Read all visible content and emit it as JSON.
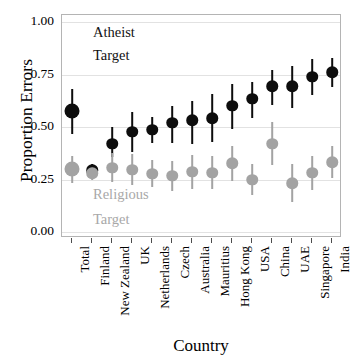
{
  "chart_data": {
    "type": "scatter",
    "title": "",
    "xlabel": "Country",
    "ylabel": "Proportion Errors",
    "ylim": [
      0.0,
      1.0
    ],
    "yticks": [
      "0.00",
      "0.25",
      "0.50",
      "0.75",
      "1.00"
    ],
    "ytick_values": [
      0.0,
      0.25,
      0.5,
      0.75,
      1.0
    ],
    "grid": "horizontal",
    "legend_position": "inside-plot-annotations",
    "categories": [
      "Total",
      "Finland",
      "New Zealand",
      "UK",
      "Netherlands",
      "Czech",
      "Australia",
      "Mauritius",
      "Hong Kong",
      "USA",
      "China",
      "UAE",
      "Singapore",
      "India"
    ],
    "annotations": [
      {
        "text": "Atheist",
        "series": "Atheist Target"
      },
      {
        "text": "Target",
        "series": "Atheist Target"
      },
      {
        "text": "Religious",
        "series": "Religious Target"
      },
      {
        "text": "Target",
        "series": "Religious Target"
      }
    ],
    "series": [
      {
        "name": "Atheist Target",
        "color": "#0d0d0d",
        "marker": "filled-circle",
        "values": [
          0.575,
          0.295,
          0.42,
          0.478,
          0.487,
          0.52,
          0.532,
          0.541,
          0.601,
          0.634,
          0.693,
          0.694,
          0.74,
          0.761
        ],
        "err_low": [
          0.468,
          0.262,
          0.358,
          0.382,
          0.425,
          0.423,
          0.42,
          0.43,
          0.492,
          0.542,
          0.605,
          0.592,
          0.65,
          0.69
        ],
        "err_high": [
          0.681,
          0.325,
          0.498,
          0.573,
          0.548,
          0.598,
          0.626,
          0.655,
          0.706,
          0.714,
          0.773,
          0.79,
          0.824,
          0.83
        ]
      },
      {
        "name": "Religious Target",
        "color": "#a3a3a3",
        "marker": "filled-circle",
        "values": [
          0.298,
          0.279,
          0.305,
          0.296,
          0.277,
          0.267,
          0.287,
          0.281,
          0.327,
          0.249,
          0.421,
          0.233,
          0.281,
          0.333
        ],
        "err_low": [
          0.232,
          0.248,
          0.236,
          0.222,
          0.213,
          0.196,
          0.206,
          0.205,
          0.244,
          0.174,
          0.317,
          0.144,
          0.2,
          0.258
        ],
        "err_high": [
          0.362,
          0.31,
          0.375,
          0.372,
          0.343,
          0.339,
          0.368,
          0.36,
          0.41,
          0.324,
          0.524,
          0.323,
          0.364,
          0.408
        ]
      }
    ]
  },
  "axes": {
    "ylabel": "Proportion Errors",
    "xlabel": "Country",
    "ytick_labels": [
      "1.00",
      "0.75",
      "0.50",
      "0.25",
      "0.00"
    ],
    "xtick_labels": [
      "Total",
      "Finland",
      "New Zealand",
      "UK",
      "Netherlands",
      "Czech",
      "Australia",
      "Mauritius",
      "Hong Kong",
      "USA",
      "China",
      "UAE",
      "Singapore",
      "India"
    ]
  },
  "annotations": {
    "atheist_line1": "Atheist",
    "atheist_line2": "Target",
    "religious_line1": "Religious",
    "religious_line2": "Target"
  },
  "colors": {
    "atheist": "#0d0d0d",
    "religious": "#a3a3a3",
    "grid": "#e2e2e2",
    "panel_border": "#b4b4b4",
    "background": "#ffffff"
  }
}
